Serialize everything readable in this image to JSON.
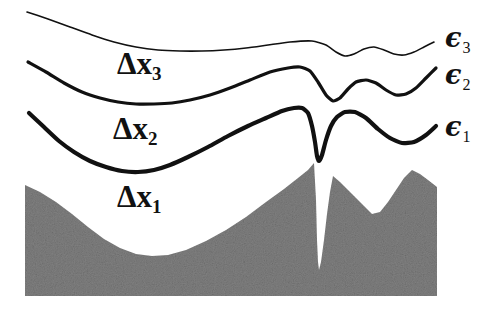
{
  "figure": {
    "width": 498,
    "height": 310,
    "background": "#ffffff"
  },
  "colors": {
    "curve": "#111111",
    "terrain_fill": "#808080",
    "terrain_noise_light": "#9a9a9a",
    "terrain_noise_dark": "#666666",
    "background": "#ffffff"
  },
  "layer_labels": [
    {
      "id": "dx3",
      "base": "Δx",
      "subscript": "3",
      "x": 117,
      "y": 48
    },
    {
      "id": "dx2",
      "base": "Δx",
      "subscript": "2",
      "x": 113,
      "y": 113
    },
    {
      "id": "dx1",
      "base": "Δx",
      "subscript": "1",
      "x": 117,
      "y": 181
    }
  ],
  "interface_labels": [
    {
      "id": "eps3",
      "base": "ϵ",
      "subscript": "3",
      "x": 445,
      "y": 24
    },
    {
      "id": "eps2",
      "base": "ϵ",
      "subscript": "2",
      "x": 445,
      "y": 61
    },
    {
      "id": "eps1",
      "base": "ϵ",
      "subscript": "1",
      "x": 445,
      "y": 113
    }
  ],
  "chart_data": {
    "type": "line",
    "xlabel": "",
    "ylabel": "",
    "xlim": [
      0,
      498
    ],
    "ylim": [
      310,
      0
    ],
    "grid": false,
    "legend_position": "right",
    "note": "Pixel coordinates, y increases downward. Three interface curves epsilon_1..epsilon_3 above a stippled gray substrate; layer thicknesses labelled Delta x_1..Delta x_3.",
    "series": [
      {
        "name": "ϵ₃",
        "label": "epsilon_3",
        "stroke": "#111111",
        "stroke_width": 1.6,
        "points": [
          [
            27,
            12
          ],
          [
            48,
            19
          ],
          [
            70,
            27
          ],
          [
            92,
            35
          ],
          [
            114,
            42
          ],
          [
            136,
            47
          ],
          [
            158,
            50
          ],
          [
            180,
            51
          ],
          [
            202,
            51
          ],
          [
            224,
            50
          ],
          [
            246,
            48
          ],
          [
            268,
            45
          ],
          [
            290,
            42
          ],
          [
            312,
            41
          ],
          [
            326,
            45
          ],
          [
            336,
            52
          ],
          [
            345,
            56
          ],
          [
            354,
            54
          ],
          [
            364,
            49
          ],
          [
            374,
            47
          ],
          [
            384,
            50
          ],
          [
            394,
            54
          ],
          [
            404,
            55
          ],
          [
            414,
            52
          ],
          [
            424,
            47
          ],
          [
            434,
            42
          ]
        ]
      },
      {
        "name": "ϵ₂",
        "label": "epsilon_2",
        "stroke": "#111111",
        "stroke_width": 3.2,
        "points": [
          [
            28,
            62
          ],
          [
            46,
            72
          ],
          [
            64,
            83
          ],
          [
            82,
            92
          ],
          [
            100,
            98
          ],
          [
            118,
            102
          ],
          [
            136,
            104
          ],
          [
            154,
            104
          ],
          [
            172,
            103
          ],
          [
            190,
            100
          ],
          [
            210,
            95
          ],
          [
            230,
            88
          ],
          [
            250,
            80
          ],
          [
            270,
            72
          ],
          [
            288,
            68
          ],
          [
            300,
            67
          ],
          [
            310,
            71
          ],
          [
            318,
            82
          ],
          [
            326,
            95
          ],
          [
            333,
            101
          ],
          [
            340,
            98
          ],
          [
            348,
            89
          ],
          [
            356,
            82
          ],
          [
            366,
            80
          ],
          [
            376,
            83
          ],
          [
            386,
            90
          ],
          [
            396,
            95
          ],
          [
            406,
            94
          ],
          [
            416,
            88
          ],
          [
            426,
            78
          ],
          [
            436,
            68
          ]
        ]
      },
      {
        "name": "ϵ₁",
        "label": "epsilon_1",
        "stroke": "#111111",
        "stroke_width": 4.2,
        "points": [
          [
            29,
            113
          ],
          [
            44,
            127
          ],
          [
            59,
            141
          ],
          [
            74,
            152
          ],
          [
            90,
            161
          ],
          [
            106,
            167
          ],
          [
            122,
            171
          ],
          [
            138,
            172
          ],
          [
            154,
            170
          ],
          [
            170,
            165
          ],
          [
            188,
            157
          ],
          [
            208,
            147
          ],
          [
            228,
            136
          ],
          [
            248,
            126
          ],
          [
            266,
            118
          ],
          [
            282,
            111
          ],
          [
            294,
            108
          ],
          [
            302,
            108
          ],
          [
            308,
            113
          ],
          [
            312,
            126
          ],
          [
            315,
            142
          ],
          [
            317,
            156
          ],
          [
            319,
            161
          ],
          [
            322,
            155
          ],
          [
            326,
            140
          ],
          [
            331,
            126
          ],
          [
            337,
            117
          ],
          [
            345,
            112
          ],
          [
            355,
            112
          ],
          [
            366,
            118
          ],
          [
            378,
            129
          ],
          [
            390,
            138
          ],
          [
            402,
            143
          ],
          [
            414,
            142
          ],
          [
            426,
            135
          ],
          [
            436,
            126
          ]
        ]
      }
    ],
    "terrain": {
      "name": "substrate",
      "fill": "#808080",
      "description": "Stippled gray solid; rises from a left shoulder to a tall peak, is split by a very narrow deep crevice, then a second peak with a V-notch before the right edge.",
      "left_edge": 25,
      "right_edge": 437,
      "bottom": 296,
      "outline": [
        [
          25,
          185
        ],
        [
          40,
          192
        ],
        [
          56,
          202
        ],
        [
          72,
          214
        ],
        [
          88,
          227
        ],
        [
          104,
          239
        ],
        [
          120,
          248
        ],
        [
          136,
          254
        ],
        [
          152,
          256
        ],
        [
          168,
          255
        ],
        [
          186,
          250
        ],
        [
          206,
          241
        ],
        [
          226,
          230
        ],
        [
          246,
          217
        ],
        [
          266,
          202
        ],
        [
          284,
          189
        ],
        [
          298,
          178
        ],
        [
          308,
          170
        ],
        [
          314,
          163
        ],
        [
          316,
          200
        ],
        [
          317,
          240
        ],
        [
          318,
          262
        ],
        [
          319,
          270
        ],
        [
          321,
          262
        ],
        [
          324,
          240
        ],
        [
          327,
          214
        ],
        [
          330,
          192
        ],
        [
          333,
          176
        ],
        [
          340,
          182
        ],
        [
          348,
          190
        ],
        [
          356,
          198
        ],
        [
          364,
          206
        ],
        [
          372,
          214
        ],
        [
          380,
          212
        ],
        [
          388,
          202
        ],
        [
          396,
          190
        ],
        [
          404,
          178
        ],
        [
          412,
          170
        ],
        [
          420,
          174
        ],
        [
          428,
          180
        ],
        [
          437,
          187
        ],
        [
          437,
          296
        ],
        [
          25,
          296
        ]
      ],
      "crevice": {
        "top_x": 316,
        "top_y": 160,
        "tip_x": 319,
        "tip_y": 272,
        "max_width_px": 8
      }
    }
  }
}
